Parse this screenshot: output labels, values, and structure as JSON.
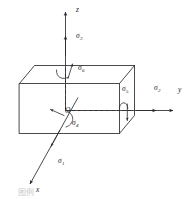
{
  "figure": {
    "kind": "stress-element-diagram",
    "background_color": "#ffffff",
    "line_color": "#2b2b2b",
    "label_color": "#1a1a1a"
  },
  "axes": [
    {
      "id": "x",
      "label": "x",
      "direction": "lower-left",
      "label_x": 36,
      "label_y": 192
    },
    {
      "id": "y",
      "label": "y",
      "direction": "right",
      "label_x": 178,
      "label_y": 92
    },
    {
      "id": "z",
      "label": "z",
      "direction": "up",
      "label_x": 76,
      "label_y": 12
    }
  ],
  "origin": {
    "label": "O",
    "label_x": 65,
    "label_y": 113
  },
  "stresses": [
    {
      "id": "sigma1",
      "symbol": "σ",
      "subscript": "1",
      "type": "normal",
      "axis": "x",
      "label_x": 58,
      "label_y": 163
    },
    {
      "id": "sigma2",
      "symbol": "σ",
      "subscript": "2",
      "type": "normal",
      "axis": "y",
      "label_x": 154,
      "label_y": 90
    },
    {
      "id": "sigma3",
      "symbol": "σ",
      "subscript": "3",
      "type": "normal",
      "axis": "z",
      "label_x": 76,
      "label_y": 38
    },
    {
      "id": "sigma4",
      "symbol": "σ",
      "subscript": "4",
      "type": "shear",
      "axis": "x",
      "label_x": 72,
      "label_y": 125
    },
    {
      "id": "sigma5",
      "symbol": "σ",
      "subscript": "5",
      "type": "shear",
      "axis": "y",
      "label_x": 122,
      "label_y": 91
    },
    {
      "id": "sigma6",
      "symbol": "σ",
      "subscript": "6",
      "type": "shear",
      "axis": "z",
      "label_x": 78,
      "label_y": 70
    }
  ],
  "caption": {
    "text": "图例"
  }
}
